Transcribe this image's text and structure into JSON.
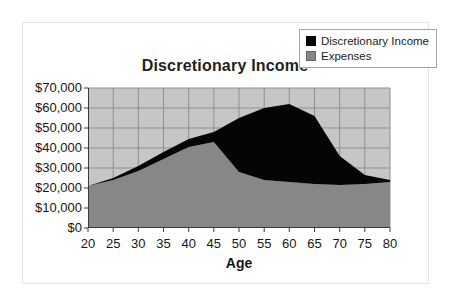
{
  "chart_data": {
    "type": "area",
    "stacked": true,
    "title": "Discretionary Income",
    "xlabel": "Age",
    "ylabel": "",
    "x": [
      20,
      25,
      30,
      35,
      40,
      45,
      50,
      55,
      60,
      65,
      70,
      75,
      80
    ],
    "x_tick_labels": [
      "20",
      "25",
      "30",
      "35",
      "40",
      "45",
      "50",
      "55",
      "60",
      "65",
      "70",
      "75",
      "80"
    ],
    "x_tick_step": 5,
    "ylim": [
      0,
      70000
    ],
    "y_tick_step": 10000,
    "y_tick_labels_top_to_bottom": [
      "$70,000",
      "$60,000",
      "$50,000",
      "$40,000",
      "$30,000",
      "$20,000",
      "$10,000",
      "$0"
    ],
    "grid": true,
    "legend_position": "top-right",
    "series": [
      {
        "name": "Discretionary Income",
        "color": "#050505",
        "values": [
          0,
          1000,
          2500,
          3500,
          4000,
          5000,
          27000,
          36000,
          39000,
          34000,
          14500,
          4500,
          1000
        ]
      },
      {
        "name": "Expenses",
        "color": "#878787",
        "values": [
          21000,
          24000,
          28500,
          34500,
          40500,
          43000,
          28000,
          24000,
          23000,
          22000,
          21500,
          22000,
          23000
        ]
      }
    ],
    "stacking_note": "Discretionary Income is drawn stacked on top of Expenses; top boundary = sum of both series",
    "colors": {
      "plot_bg": "#c6c6c6",
      "gridline": "#8f8f8f",
      "axis": "#3a3a3a",
      "frame_border": "#e4e4e4",
      "page_bg": "#ffffff"
    }
  }
}
